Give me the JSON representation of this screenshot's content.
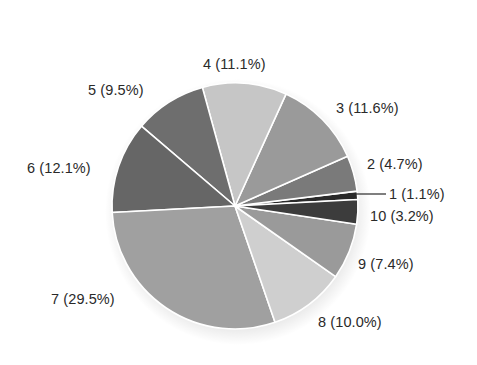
{
  "chart_data": {
    "type": "pie",
    "title": "",
    "categories": [
      "1",
      "2",
      "3",
      "4",
      "5",
      "6",
      "7",
      "8",
      "9",
      "10"
    ],
    "values": [
      1.1,
      4.7,
      11.6,
      11.1,
      9.5,
      12.1,
      29.5,
      10.0,
      7.4,
      3.2
    ],
    "unit": "%",
    "direction": "counterclockwise",
    "start_angle_deg_screen": -3,
    "labels": [
      "1 (1.1%)",
      "2 (4.7%)",
      "3 (11.6%)",
      "4 (11.1%)",
      "5 (9.5%)",
      "6 (12.1%)",
      "7 (29.5%)",
      "8 (10.0%)",
      "9 (7.4%)",
      "10 (3.2%)"
    ],
    "legend": "none",
    "colors": [
      "#2a2a2a",
      "#7a7a7a",
      "#9a9a9a",
      "#c6c6c6",
      "#6e6e6e",
      "#666666",
      "#a0a0a0",
      "#cfcfcf",
      "#9a9a9a",
      "#3c3c3c"
    ]
  },
  "layout": {
    "center": [
      235,
      206
    ],
    "radius": 123,
    "separator_color": "#ffffff",
    "label_positions": [
      {
        "x": 389,
        "y": 194
      },
      {
        "x": 367,
        "y": 164
      },
      {
        "x": 336,
        "y": 108
      },
      {
        "x": 203,
        "y": 64
      },
      {
        "x": 88,
        "y": 90
      },
      {
        "x": 27,
        "y": 168
      },
      {
        "x": 51,
        "y": 299
      },
      {
        "x": 318,
        "y": 322
      },
      {
        "x": 358,
        "y": 264
      },
      {
        "x": 370,
        "y": 216
      }
    ],
    "leader_line": {
      "slice": 0,
      "x1": 355,
      "y1": 194,
      "x2": 386,
      "y2": 194,
      "color": "#2a2a2a"
    }
  }
}
